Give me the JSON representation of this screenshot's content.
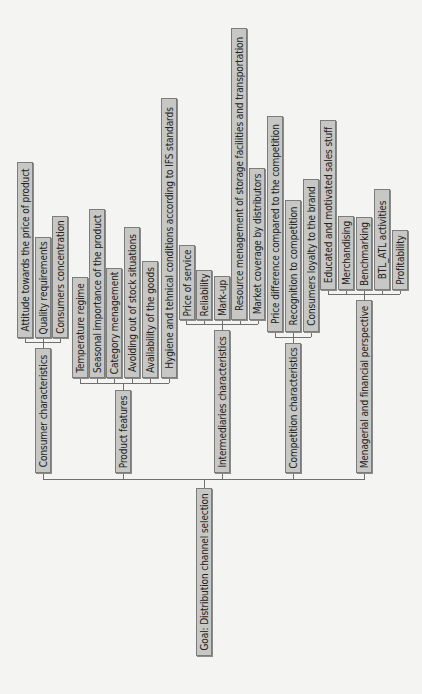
{
  "diagram": {
    "goal": "Goal: Distribution channel selection",
    "criteria": [
      {
        "label": "Consumer characteristics",
        "subcriteria": [
          "Attitude towards the price of product",
          "Quality requirements",
          "Consumers concentration"
        ]
      },
      {
        "label": "Product features",
        "subcriteria": [
          "Temperature regime",
          "Seasonal importance of the product",
          "Category menagement",
          "Avoiding out of stock situations",
          "Availability of the goods",
          "Hygiene and tehnical conditions according to IFS standards"
        ]
      },
      {
        "label": "Intermediaries characteristics",
        "subcriteria": [
          "Price of service",
          "Reliability",
          "Mark-up",
          "Resource menagement of storage facilities and transportation",
          "Market coverage by distributors"
        ]
      },
      {
        "label": "Competition characteristics",
        "subcriteria": [
          "Price difference compared to the competition",
          "Recognition to competition",
          "Consumers loyalty to the brand"
        ]
      },
      {
        "label": "Menagerial and financial perspective",
        "subcriteria": [
          "Educated and motivated sales stuff",
          "Merchandising",
          "Benchmarking",
          "BTL_ATL activities",
          "Profitability"
        ]
      }
    ]
  },
  "colors": {
    "node_fill": "#c7c7c5",
    "node_border": "#7c7c7a",
    "line": "#6f6f6d",
    "background": "#f4f4f2"
  }
}
